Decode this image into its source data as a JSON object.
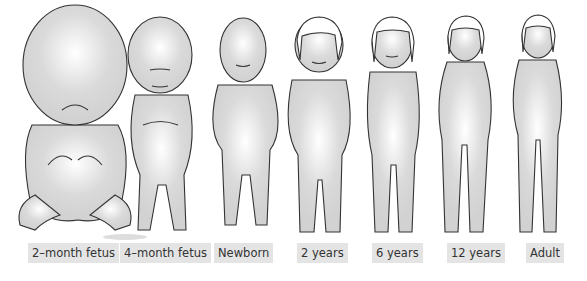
{
  "figures": [
    {
      "id": "2-month-fetus",
      "label": "2–month fetus",
      "label_x": 28
    },
    {
      "id": "4-month-fetus",
      "label": "4–month fetus",
      "label_x": 120
    },
    {
      "id": "newborn",
      "label": "Newborn",
      "label_x": 214
    },
    {
      "id": "2-years",
      "label": "2 years",
      "label_x": 297
    },
    {
      "id": "6-years",
      "label": "6 years",
      "label_x": 372
    },
    {
      "id": "12-years",
      "label": "12 years",
      "label_x": 447
    },
    {
      "id": "adult",
      "label": "Adult",
      "label_x": 526
    }
  ],
  "colors": {
    "skin": "#d8d8d8",
    "highlight": "#ffffff",
    "outline": "#333333",
    "label_bg": "#e4e4e4"
  }
}
